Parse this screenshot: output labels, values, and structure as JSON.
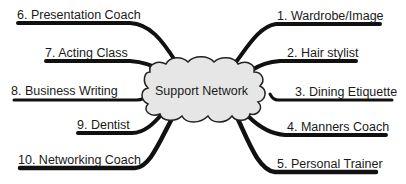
{
  "diagram": {
    "type": "mind-map",
    "center": {
      "label": "Support Network",
      "shape": "cloud",
      "fill": "#e6e6e6"
    },
    "branches": [
      {
        "id": 1,
        "label": "1. Wardrobe/Image",
        "side": "right"
      },
      {
        "id": 2,
        "label": "2. Hair stylist",
        "side": "right"
      },
      {
        "id": 3,
        "label": "3. Dining Etiquette",
        "side": "right"
      },
      {
        "id": 4,
        "label": "4. Manners Coach",
        "side": "right"
      },
      {
        "id": 5,
        "label": "5. Personal Trainer",
        "side": "right"
      },
      {
        "id": 6,
        "label": "6. Presentation Coach",
        "side": "left"
      },
      {
        "id": 7,
        "label": "7. Acting Class",
        "side": "left"
      },
      {
        "id": 8,
        "label": "8. Business Writing",
        "side": "left"
      },
      {
        "id": 9,
        "label": "9. Dentist",
        "side": "left"
      },
      {
        "id": 10,
        "label": "10. Networking Coach",
        "side": "left"
      }
    ],
    "colors": {
      "line": "#111111",
      "cloud_fill": "#e6e6e6",
      "cloud_stroke": "#222222",
      "text": "#1a1a1a"
    }
  }
}
